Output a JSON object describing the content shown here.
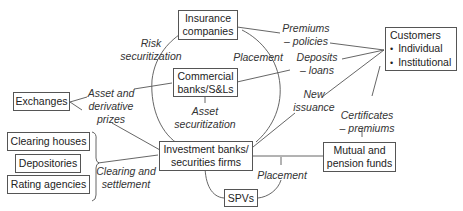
{
  "diagram": {
    "nodes": {
      "insurance": {
        "line1": "Insurance",
        "line2": "companies"
      },
      "commercial": {
        "line1": "Commercial",
        "line2": "banks/S&Ls"
      },
      "investment": {
        "line1": "Investment banks/",
        "line2": "securities firms"
      },
      "customers": {
        "title": "Customers",
        "items": [
          "Individual",
          "Institutional"
        ]
      },
      "mutual": {
        "line1": "Mutual and",
        "line2": "pension funds"
      },
      "spvs": {
        "label": "SPVs"
      },
      "exchanges": {
        "label": "Exchanges"
      },
      "clearing_houses": {
        "label": "Clearing houses"
      },
      "depositories": {
        "label": "Depositories"
      },
      "rating_agencies": {
        "label": "Rating agencies"
      }
    },
    "edge_labels": {
      "risk_securitization": {
        "line1": "Risk",
        "line2": "securitization"
      },
      "placement_top": {
        "label": "Placement"
      },
      "premiums": {
        "line1": "Premiums",
        "line2": "– policies"
      },
      "deposits": {
        "line1": "Deposits",
        "line2": "– loans"
      },
      "new_issuance": {
        "line1": "New",
        "line2": "issuance"
      },
      "certificates": {
        "line1": "Certificates",
        "line2": "– premiums"
      },
      "asset_derivative": {
        "line1": "Asset and",
        "line2": "derivative",
        "line3": "prizes"
      },
      "asset_securitization": {
        "line1": "Asset",
        "line2": "securitization"
      },
      "clearing_settlement": {
        "line1": "Clearing and",
        "line2": "settlement"
      },
      "placement_bottom": {
        "label": "Placement"
      }
    },
    "colors": {
      "line": "#555555",
      "text": "#222222",
      "background": "#ffffff"
    }
  }
}
